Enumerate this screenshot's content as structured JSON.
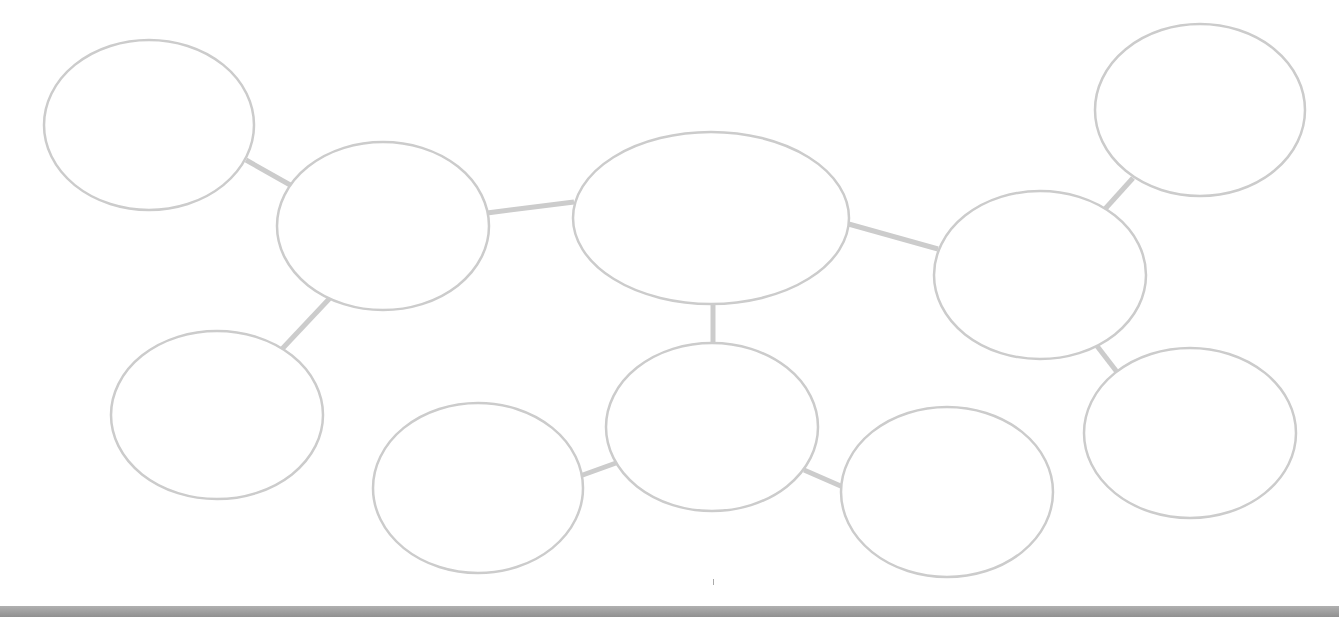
{
  "diagram": {
    "type": "bubble-map",
    "stroke_color": "#cccccc",
    "connector_color": "#cccccc",
    "nodes": [
      {
        "id": "n1",
        "cx": 149,
        "cy": 125,
        "rx": 105,
        "ry": 85,
        "label": ""
      },
      {
        "id": "n2",
        "cx": 383,
        "cy": 226,
        "rx": 106,
        "ry": 84,
        "label": ""
      },
      {
        "id": "center",
        "cx": 711,
        "cy": 218,
        "rx": 138,
        "ry": 86,
        "label": ""
      },
      {
        "id": "n4",
        "cx": 1040,
        "cy": 275,
        "rx": 106,
        "ry": 84,
        "label": ""
      },
      {
        "id": "n5",
        "cx": 1200,
        "cy": 110,
        "rx": 105,
        "ry": 86,
        "label": ""
      },
      {
        "id": "n6",
        "cx": 217,
        "cy": 415,
        "rx": 106,
        "ry": 84,
        "label": ""
      },
      {
        "id": "n7",
        "cx": 712,
        "cy": 427,
        "rx": 106,
        "ry": 84,
        "label": ""
      },
      {
        "id": "n8",
        "cx": 478,
        "cy": 488,
        "rx": 105,
        "ry": 85,
        "label": ""
      },
      {
        "id": "n9",
        "cx": 947,
        "cy": 492,
        "rx": 106,
        "ry": 85,
        "label": ""
      },
      {
        "id": "n10",
        "cx": 1190,
        "cy": 433,
        "rx": 106,
        "ry": 85,
        "label": ""
      }
    ],
    "edges": [
      {
        "from": "n1",
        "to": "n2",
        "x1": 246,
        "y1": 160,
        "x2": 292,
        "y2": 186
      },
      {
        "from": "n2",
        "to": "center",
        "x1": 487,
        "y1": 213,
        "x2": 574,
        "y2": 202
      },
      {
        "from": "n2",
        "to": "n6",
        "x1": 330,
        "y1": 298,
        "x2": 282,
        "y2": 349
      },
      {
        "from": "center",
        "to": "n4",
        "x1": 845,
        "y1": 223,
        "x2": 938,
        "y2": 249
      },
      {
        "from": "center",
        "to": "n7",
        "x1": 713,
        "y1": 304,
        "x2": 713,
        "y2": 344
      },
      {
        "from": "n4",
        "to": "n5",
        "x1": 1105,
        "y1": 209,
        "x2": 1133,
        "y2": 178
      },
      {
        "from": "n4",
        "to": "n10",
        "x1": 1097,
        "y1": 346,
        "x2": 1117,
        "y2": 372
      },
      {
        "from": "n7",
        "to": "n8",
        "x1": 616,
        "y1": 463,
        "x2": 580,
        "y2": 476
      },
      {
        "from": "n7",
        "to": "n9",
        "x1": 804,
        "y1": 470,
        "x2": 843,
        "y2": 487
      }
    ]
  }
}
